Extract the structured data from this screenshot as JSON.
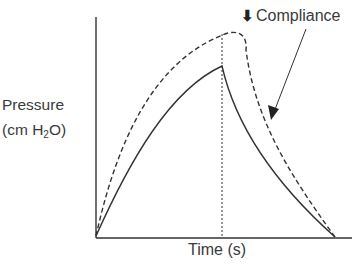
{
  "diagram": {
    "title": "",
    "y_axis": {
      "label_line1": "Pressure",
      "label_line2_prefix": "(cm H",
      "label_line2_sub": "2",
      "label_line2_suffix": "O)"
    },
    "x_axis": {
      "label": "Time (s)"
    },
    "annotation": {
      "arrow_glyph": "⬇",
      "text": "Compliance",
      "meaning": "decreased compliance"
    },
    "curves": [
      {
        "name": "normal-compliance",
        "style": "solid",
        "description": "Pressure rises during inspiration, peaks, then decays exponentially"
      },
      {
        "name": "decreased-compliance",
        "style": "dashed",
        "description": "Higher peak pressure curve with decreased compliance"
      }
    ],
    "marker": {
      "name": "end-inspiration",
      "style": "dotted-vertical"
    },
    "colors": {
      "line": "#333333",
      "background": "#ffffff"
    }
  }
}
